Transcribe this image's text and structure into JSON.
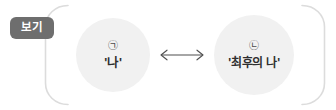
{
  "figure": {
    "badge": {
      "label": "보기"
    },
    "frame": {
      "style": "open-bracket",
      "line_color": "#dcdcdc"
    },
    "nodes": [
      {
        "marker": "㉠",
        "marker_name": "circled-giyeok",
        "text": "'나'",
        "fill_color": "#f1f1f1"
      },
      {
        "marker": "㉡",
        "marker_name": "circled-nieun",
        "text": "'최후의 나'",
        "fill_color": "#f1f1f1"
      }
    ],
    "connector": {
      "glyph": "↔",
      "name": "double-headed-arrow",
      "color": "#4f4f4f"
    }
  }
}
